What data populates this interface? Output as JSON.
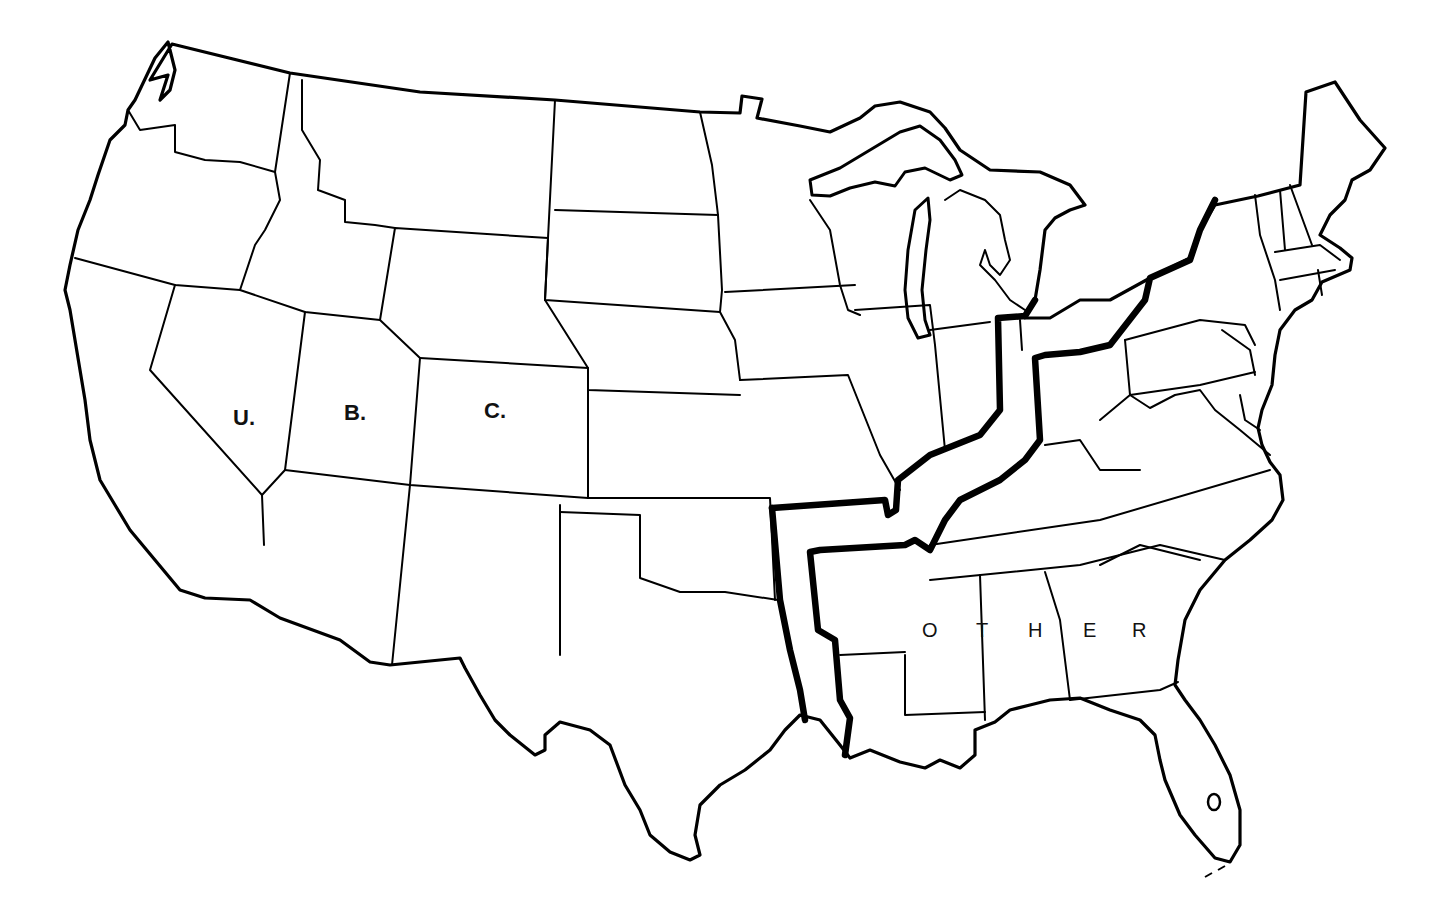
{
  "map": {
    "title": "",
    "type": "outline map of contiguous United States",
    "colors": {
      "background": "#ffffff",
      "lines": "#000000"
    },
    "labels": {
      "u": {
        "text": "U.",
        "x": 233,
        "y": 420
      },
      "b": {
        "text": "B.",
        "x": 344,
        "y": 415
      },
      "c": {
        "text": "C.",
        "x": 484,
        "y": 412
      }
    },
    "other_letters": [
      {
        "text": "O",
        "x": 922,
        "y": 630
      },
      {
        "text": "T",
        "x": 976,
        "y": 630
      },
      {
        "text": "H",
        "x": 1028,
        "y": 630
      },
      {
        "text": "E",
        "x": 1083,
        "y": 630
      },
      {
        "text": "R",
        "x": 1132,
        "y": 630
      }
    ],
    "regions": [
      {
        "name": "U.B.C. (western region)",
        "label": "U. B. C."
      },
      {
        "name": "Middle corridor",
        "label": ""
      },
      {
        "name": "Other",
        "label": "OTHER"
      }
    ]
  }
}
